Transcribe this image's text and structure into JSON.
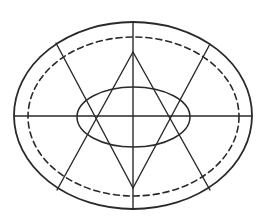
{
  "diagram": {
    "title": "",
    "colors": {
      "stroke": "#2a2a2a",
      "background": "#ffffff"
    },
    "outer_ellipse": {
      "cx": 133,
      "cy": 115.5,
      "rx": 119,
      "ry": 93.5,
      "stroke_width": 1.8
    },
    "dashed_ellipse": {
      "cx": 133.5,
      "cy": 116.5,
      "rx": 105.5,
      "ry": 79.5,
      "stroke_width": 1.6,
      "dash": "6 4"
    },
    "inner_ellipse": {
      "cx": 133.5,
      "cy": 117,
      "rx": 56.5,
      "ry": 30,
      "stroke_width": 1.5
    },
    "axes": {
      "horizontal": {
        "x1": 14,
        "y1": 116,
        "x2": 252,
        "y2": 116
      },
      "vertical": {
        "x1": 133,
        "y1": 22,
        "x2": 133,
        "y2": 209
      }
    },
    "star_lines": [
      {
        "x1": 56,
        "y1": 43,
        "x2": 133,
        "y2": 188
      },
      {
        "x1": 210,
        "y1": 44,
        "x2": 133,
        "y2": 188
      },
      {
        "x1": 57,
        "y1": 190,
        "x2": 133,
        "y2": 52
      },
      {
        "x1": 210,
        "y1": 190,
        "x2": 133,
        "y2": 52
      }
    ]
  }
}
